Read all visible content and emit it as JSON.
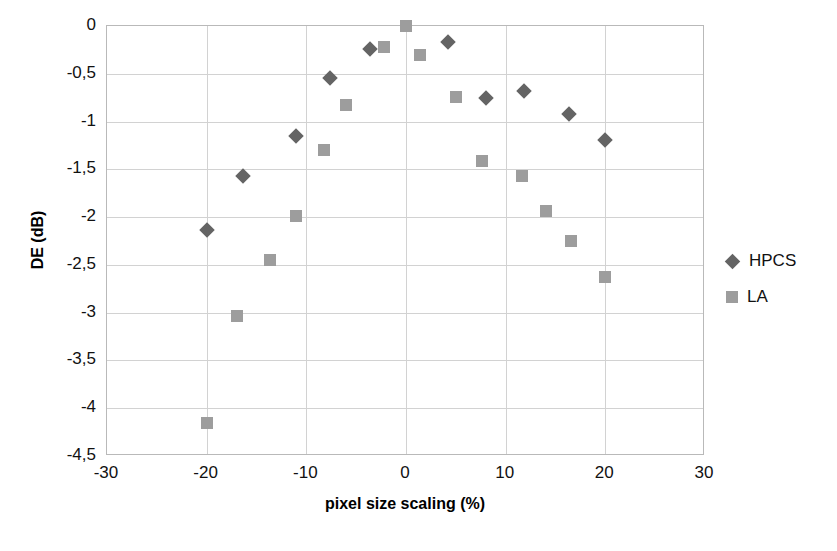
{
  "chart_data": {
    "type": "scatter",
    "title": "",
    "xlabel": "pixel size scaling  (%)",
    "ylabel": "DE (dB)",
    "xlim": [
      -30,
      30
    ],
    "ylim": [
      -4.5,
      0
    ],
    "xticks": [
      "-30",
      "-20",
      "-10",
      "0",
      "10",
      "20",
      "30"
    ],
    "xtick_values": [
      -30,
      -20,
      -10,
      0,
      10,
      20,
      30
    ],
    "yticks": [
      "0",
      "-0,5",
      "-1",
      "-1,5",
      "-2",
      "-2,5",
      "-3",
      "-3,5",
      "-4",
      "-4,5"
    ],
    "ytick_values": [
      0,
      -0.5,
      -1,
      -1.5,
      -2,
      -2.5,
      -3,
      -3.5,
      -4,
      -4.5
    ],
    "grid": true,
    "legend_position": "right",
    "decimal_separator": ",",
    "series": [
      {
        "name": "HPCS",
        "marker": "diamond",
        "color": "#646464",
        "points": [
          {
            "x": -20.0,
            "y": -2.13
          },
          {
            "x": -16.4,
            "y": -1.57
          },
          {
            "x": -11.0,
            "y": -1.15
          },
          {
            "x": -7.6,
            "y": -0.54
          },
          {
            "x": -3.6,
            "y": -0.24
          },
          {
            "x": 4.2,
            "y": -0.17
          },
          {
            "x": 8.0,
            "y": -0.75
          },
          {
            "x": 11.8,
            "y": -0.68
          },
          {
            "x": 16.4,
            "y": -0.92
          },
          {
            "x": 20.0,
            "y": -1.19
          }
        ]
      },
      {
        "name": "LA",
        "marker": "square",
        "color": "#9d9d9d",
        "points": [
          {
            "x": -20.0,
            "y": -4.15
          },
          {
            "x": -17.0,
            "y": -3.04
          },
          {
            "x": -13.6,
            "y": -2.45
          },
          {
            "x": -11.0,
            "y": -1.99
          },
          {
            "x": -8.2,
            "y": -1.3
          },
          {
            "x": -6.0,
            "y": -0.83
          },
          {
            "x": -2.2,
            "y": -0.22
          },
          {
            "x": 0.0,
            "y": 0.0
          },
          {
            "x": 1.4,
            "y": -0.3
          },
          {
            "x": 5.0,
            "y": -0.74
          },
          {
            "x": 7.6,
            "y": -1.41
          },
          {
            "x": 11.6,
            "y": -1.57
          },
          {
            "x": 14.0,
            "y": -1.94
          },
          {
            "x": 16.6,
            "y": -2.25
          },
          {
            "x": 20.0,
            "y": -2.63
          }
        ]
      }
    ]
  },
  "legend": {
    "items": [
      {
        "label": "HPCS",
        "marker": "diamond"
      },
      {
        "label": "LA",
        "marker": "square"
      }
    ]
  },
  "artifact": {
    "text": ""
  }
}
